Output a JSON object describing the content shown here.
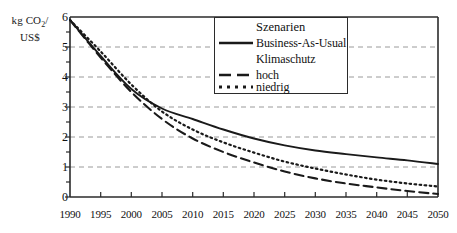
{
  "chart_data": {
    "type": "line",
    "title": "",
    "xlabel": "",
    "ylabel": "kg CO2/ US$",
    "ylabel_line1": "kg CO",
    "ylabel_sub": "2",
    "ylabel_line1_tail": "/",
    "ylabel_line2": "US$",
    "grid": true,
    "xlim": [
      1990,
      2050
    ],
    "ylim": [
      0,
      6
    ],
    "x": [
      1990,
      1995,
      2000,
      2005,
      2010,
      2015,
      2020,
      2025,
      2030,
      2035,
      2040,
      2045,
      2050
    ],
    "xticklabels": [
      "1990",
      "1995",
      "2000",
      "2005",
      "2010",
      "2015",
      "2020",
      "2025",
      "2030",
      "2035",
      "2040",
      "2045",
      "2050"
    ],
    "yticklabels": [
      "0",
      "1",
      "2",
      "3",
      "4",
      "5",
      "6"
    ],
    "yticks": [
      0,
      1,
      2,
      3,
      4,
      5,
      6
    ],
    "legend_position": "top-center",
    "series": [
      {
        "name": "Business-As-Usual",
        "style": "solid",
        "color": "#1a1a1a",
        "values": [
          5.9,
          4.7,
          3.6,
          2.95,
          2.6,
          2.25,
          1.95,
          1.72,
          1.55,
          1.43,
          1.32,
          1.22,
          1.1
        ]
      },
      {
        "name": "hoch",
        "style": "dashed",
        "color": "#1a1a1a",
        "values": [
          5.9,
          4.65,
          3.5,
          2.6,
          1.95,
          1.5,
          1.15,
          0.85,
          0.62,
          0.45,
          0.32,
          0.2,
          0.1
        ]
      },
      {
        "name": "niedrig",
        "style": "dotted",
        "color": "#1a1a1a",
        "values": [
          5.9,
          4.85,
          3.75,
          2.85,
          2.25,
          1.82,
          1.48,
          1.18,
          0.95,
          0.75,
          0.58,
          0.45,
          0.35
        ]
      }
    ]
  },
  "legend": {
    "title": "Szenarien",
    "entries": [
      {
        "label": "Business-As-Usual",
        "style": "solid"
      },
      {
        "label": "Klimaschutz",
        "style": "none"
      },
      {
        "label": "hoch",
        "style": "dashed"
      },
      {
        "label": "niedrig",
        "style": "dotted"
      }
    ]
  },
  "colors": {
    "line": "#1a1a1a",
    "grid": "#9a9a9a",
    "axis": "#2b2b2b",
    "background": "#ffffff"
  }
}
